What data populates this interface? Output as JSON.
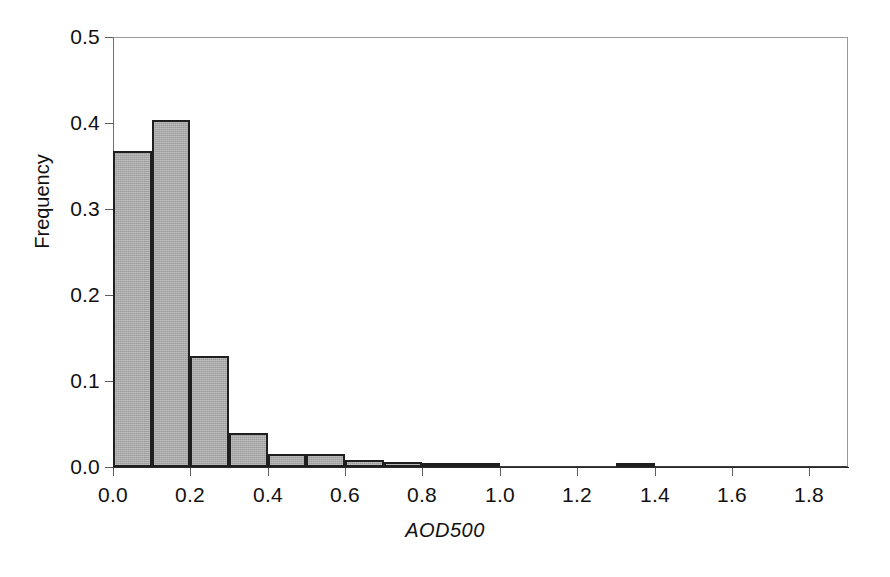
{
  "chart_data": {
    "type": "bar",
    "subtype": "histogram",
    "title": "",
    "xlabel": "AOD500",
    "ylabel": "Frequency",
    "xlim": [
      0.0,
      1.9
    ],
    "ylim": [
      0.0,
      0.5
    ],
    "grid": false,
    "legend": null,
    "bin_width": 0.1,
    "x_ticks": [
      "0.0",
      "0.2",
      "0.4",
      "0.6",
      "0.8",
      "1.0",
      "1.2",
      "1.4",
      "1.6",
      "1.8"
    ],
    "x_tick_values": [
      0.0,
      0.2,
      0.4,
      0.6,
      0.8,
      1.0,
      1.2,
      1.4,
      1.6,
      1.8
    ],
    "y_ticks": [
      "0.0",
      "0.1",
      "0.2",
      "0.3",
      "0.4",
      "0.5"
    ],
    "y_tick_values": [
      0.0,
      0.1,
      0.2,
      0.3,
      0.4,
      0.5
    ],
    "bins": [
      {
        "x0": 0.0,
        "x1": 0.1,
        "value": 0.368
      },
      {
        "x0": 0.1,
        "x1": 0.2,
        "value": 0.403
      },
      {
        "x0": 0.2,
        "x1": 0.3,
        "value": 0.129
      },
      {
        "x0": 0.3,
        "x1": 0.4,
        "value": 0.04
      },
      {
        "x0": 0.4,
        "x1": 0.5,
        "value": 0.015
      },
      {
        "x0": 0.5,
        "x1": 0.6,
        "value": 0.015
      },
      {
        "x0": 0.6,
        "x1": 0.7,
        "value": 0.008
      },
      {
        "x0": 0.7,
        "x1": 0.8,
        "value": 0.006
      },
      {
        "x0": 0.8,
        "x1": 0.9,
        "value": 0.002
      },
      {
        "x0": 0.9,
        "x1": 1.0,
        "value": 0.002
      },
      {
        "x0": 1.3,
        "x1": 1.4,
        "value": 0.003
      }
    ]
  },
  "axes": {
    "x_title": "AOD500",
    "y_title": "Frequency"
  },
  "style": {
    "bar_fill": "#aaaaaa",
    "bar_edge": "#1f1f1f",
    "axis_color": "#2b2b2b",
    "frame_color": "#9a9a9a",
    "text_color": "#111111",
    "background": "#ffffff"
  }
}
